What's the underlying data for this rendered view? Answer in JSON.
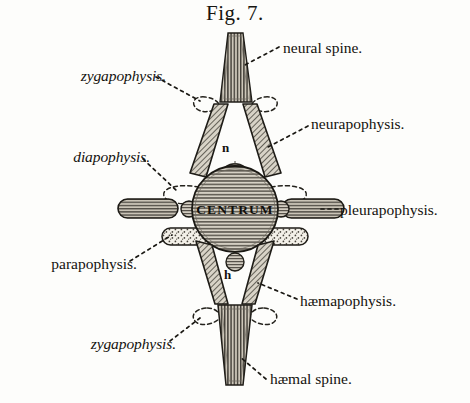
{
  "figure": {
    "title": "Fig. 7."
  },
  "labels": {
    "neural_spine": "neural spine.",
    "neurapophysis": "neurapophysis.",
    "pleurapophysis": "pleurapophysis.",
    "haemapophysis": "hæmapophysis.",
    "haemal_spine": "hæmal spine.",
    "zygapophysis_top": "zygapophysis.",
    "zygapophysis_bottom": "zygapophysis.",
    "diapophysis": "diapophysis.",
    "parapophysis": "parapophysis.",
    "centrum": "CENTRUM"
  },
  "markers": {
    "neural_canal": "n",
    "haemal_canal": "h"
  },
  "colors": {
    "paper": "#fdfdfb",
    "ink": "#14120e",
    "hatch": "#4a463f",
    "light_fill": "#cfc9bd",
    "stipple_fill": "#efece3"
  }
}
